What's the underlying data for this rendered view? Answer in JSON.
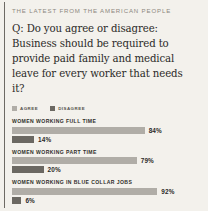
{
  "kicker": "THE LATEST FROM THE AMERICAN PEOPLE",
  "question": "Q: Do you agree or disagree: Business should be required to provide paid family and medical leave for every worker that needs it?",
  "legend": [
    {
      "label": "AGREE",
      "color": "#b0ada7"
    },
    {
      "label": "DISAGREE",
      "color": "#6b6862"
    }
  ],
  "colors": {
    "background": "#f3f1ec",
    "rule": "#6d6a64",
    "agree": "#b0ada7",
    "disagree": "#6b6862",
    "kicker_text": "#8d8880",
    "body_text": "#2b2a28"
  },
  "chart_data": {
    "type": "bar",
    "title": "Q: Do you agree or disagree: Business should be required to provide paid family and medical leave for every worker that needs it?",
    "xlabel": "",
    "ylabel": "",
    "xlim": [
      0,
      100
    ],
    "grid": false,
    "legend_position": "top-left",
    "orientation": "horizontal",
    "categories": [
      "WOMEN WORKING FULL TIME",
      "WOMEN WORKING PART TIME",
      "WOMEN WORKING IN BLUE COLLAR JOBS"
    ],
    "series": [
      {
        "name": "AGREE",
        "color": "#b0ada7",
        "values": [
          84,
          79,
          92
        ],
        "labels": [
          "84%",
          "79%",
          "92%"
        ]
      },
      {
        "name": "DISAGREE",
        "color": "#6b6862",
        "values": [
          14,
          20,
          6
        ],
        "labels": [
          "14%",
          "20%",
          "6%"
        ]
      }
    ]
  }
}
